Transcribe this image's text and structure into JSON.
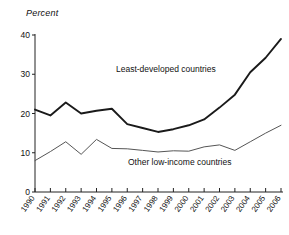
{
  "chart_data": {
    "type": "line",
    "title": "",
    "subtitle": "",
    "ylabel": "Percent",
    "xlabel": "",
    "grid": false,
    "legend_position": "inline-annotation",
    "ylim": [
      0,
      40
    ],
    "yticks": [
      0,
      10,
      20,
      30,
      40
    ],
    "ytick_labels": [
      "0",
      "10",
      "20",
      "30",
      "40"
    ],
    "categories": [
      "1990",
      "1991",
      "1992",
      "1993",
      "1994",
      "1995",
      "1996",
      "1997",
      "1998",
      "1999",
      "2000",
      "2001",
      "2002",
      "2003",
      "2004",
      "2005",
      "2006"
    ],
    "series": [
      {
        "name": "Least-developed countries",
        "color": "#1a1a1a",
        "width": 1.9,
        "values": [
          21.0,
          19.5,
          22.8,
          20.0,
          20.7,
          21.2,
          17.3,
          16.3,
          15.3,
          16.0,
          17.0,
          18.5,
          21.5,
          24.8,
          30.5,
          34.2,
          39.0
        ]
      },
      {
        "name": "Other low-income countries",
        "color": "#555555",
        "width": 1.0,
        "values": [
          8.0,
          10.3,
          12.8,
          9.6,
          13.4,
          11.1,
          11.0,
          10.6,
          10.2,
          10.5,
          10.4,
          11.5,
          12.0,
          10.6,
          12.8,
          15.0,
          17.0
        ]
      }
    ],
    "annotations": [
      {
        "text": "Least-developed countries",
        "x": 116,
        "y": 72
      },
      {
        "text": "Other low-income countries",
        "x": 128,
        "y": 165
      }
    ]
  },
  "labels": {
    "y_axis_title": "Percent",
    "series_one": "Least-developed countries",
    "series_two": "Other low-income countries"
  }
}
